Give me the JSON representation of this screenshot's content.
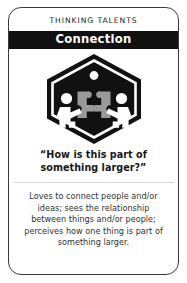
{
  "card": {
    "eyebrow": "THINKING TALENTS",
    "title": "Connection",
    "quote_line_1": "“How is this part of",
    "quote_line_2": "something larger?”",
    "description": "Loves to connect people and/or ideas; sees the relationship between things and/or people; perceives how one thing is part of something larger.",
    "badge": {
      "icon_name": "connection-badge-hexagon",
      "shape": "hexagon",
      "accent_dot": "circle",
      "figures": 2,
      "puzzle_pieces": 2,
      "colors": {
        "hexagon_fill": "#111111",
        "inner_ring": "#ffffff",
        "figure_fill": "#ffffff",
        "puzzle_fill": "#9a9a9a",
        "dot_fill": "#ffffff"
      }
    },
    "colors": {
      "card_background": "#ffffff",
      "card_border": "#3a3a3a",
      "title_band_background": "#111111",
      "title_text": "#ffffff",
      "eyebrow_text": "#1d1d1d",
      "quote_text": "#16181a",
      "description_text": "#2e3133",
      "divider": "#d8d8d8"
    }
  }
}
